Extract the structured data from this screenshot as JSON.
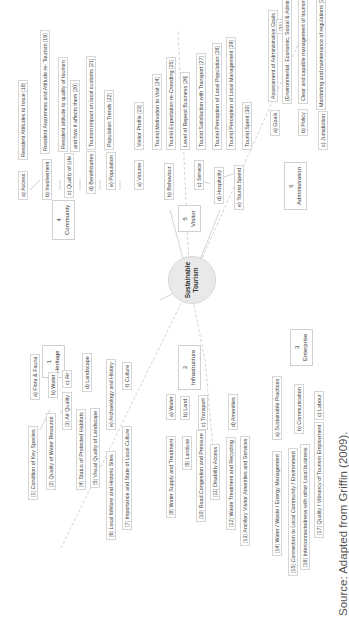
{
  "center": {
    "line1": "Sustainable",
    "line2": "Tourism"
  },
  "categories": [
    {
      "num": "1",
      "label": "Heritage"
    },
    {
      "num": "2",
      "label": "Infrastructure"
    },
    {
      "num": "3",
      "label": "Enterprise"
    },
    {
      "num": "4",
      "label": "Community"
    },
    {
      "num": "5",
      "label": "Visitor"
    },
    {
      "num": "6",
      "label": "Administration"
    }
  ],
  "heritage": {
    "subs": [
      "a) Flora & Fauna",
      "b) Water",
      "c) Air",
      "d) Landscape",
      "e) Archaeology and History",
      "f) Culture"
    ],
    "leaves": [
      "[1] Condition of Key Species",
      "[2] Quality of Water Resource",
      "[3] Air Quality",
      "[4] Status of Protected Habitats",
      "[5] Visual Quality of Landscape",
      "[6] Local folklore and Historic Sites",
      "[7] Importance and State of Local Culture"
    ]
  },
  "infrastructure": {
    "subs": [
      "a) Water",
      "b) Land",
      "c) Transport",
      "d) Amenities"
    ],
    "leaves": [
      "[8] Water Supply and Treatment",
      "[9] Landuse",
      "[10] Road Congestion and Pressure",
      "[11] Disability Access",
      "[12] Waste Treatment and Recycling",
      "[13] Ancillary Visitor Amenities and Services"
    ]
  },
  "enterprise": {
    "subs": [
      "a) Sustainable Practices",
      "b) Communication",
      "c) Labour"
    ],
    "leaves": [
      "[14] Water / Waste / Energy Management",
      "[15] Connection to Local Community / Environment",
      "[16] Interconnectedness with other Local business",
      "[17] Quality / Vibrancy of Tourism Employment"
    ]
  },
  "community": {
    "subs": [
      "a) Access",
      "b) Involvement",
      "c) Quality of Life",
      "d) Beneficiaries",
      "e) Population"
    ],
    "leaves": [
      "Resident Attitudes to Issue [18]",
      "Resident Awareness and Attitude re- Tourism [19]",
      "Resident attitude to quality of tourism",
      "and how it affects them [20]",
      "Tourism impact on local customs [21]",
      "Population Trends [22]"
    ]
  },
  "visitor": {
    "subs": [
      "a) Volume",
      "b) Behaviour",
      "c) Service",
      "d) Hospitality",
      "e) Tourist Spend"
    ],
    "leaves": [
      "Visitor Profile [23]",
      "Tourist Motivation to Visit [24]",
      "Tourist Expectation re-Crowding [25]",
      "Level of Repeat Business [26]",
      "Tourist Satisfaction with Transport [27]",
      "Tourist Perception of Local Population [28]",
      "Tourist Perception of Local Management [29]",
      "Tourist Spent [30]"
    ]
  },
  "administration": {
    "subs": [
      "a) Goals",
      "b) Policy",
      "c) Jurisdiction"
    ],
    "leaves": [
      "Assessment of Administrative Goals",
      "[31]",
      "(Environmental, Economic, Social & Administrative)",
      "Clear and capable management of tourism [32]",
      "Monitoring and maintenance of regulations [33]"
    ]
  },
  "source": "Source: Adapted from Griffin (2009)."
}
